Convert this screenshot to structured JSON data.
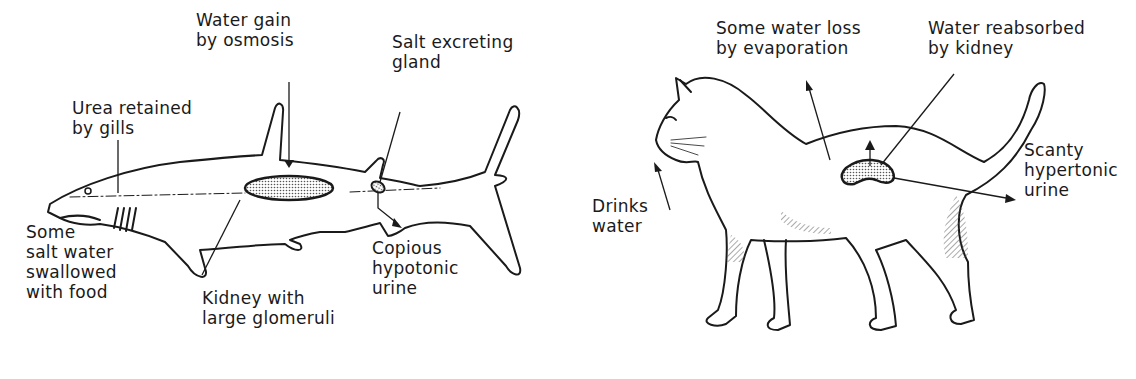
{
  "shark": {
    "labels": {
      "water_gain": "Water gain\nby osmosis",
      "salt_gland": "Salt excreting\ngland",
      "urea": "Urea retained\nby gills",
      "salt_water": "Some\nsalt water\nswallowed\nwith food",
      "kidney": "Kidney with\nlarge glomeruli",
      "urine": "Copious\nhypotonic\nurine"
    }
  },
  "cat": {
    "labels": {
      "evaporation": "Some water loss\nby evaporation",
      "reabsorbed": "Water reabsorbed\nby kidney",
      "drinks": "Drinks\nwater",
      "urine": "Scanty\nhypertonic\nurine"
    }
  },
  "colors": {
    "ink": "#1a1a1a",
    "stipple": "#bdbdbd",
    "background": "#ffffff"
  }
}
